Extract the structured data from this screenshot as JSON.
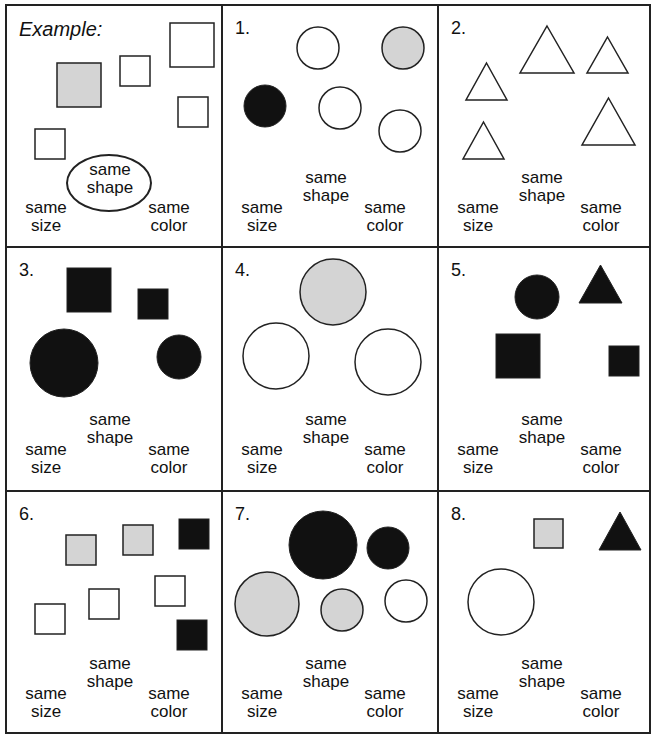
{
  "colors": {
    "line": "#222222",
    "black": "#111111",
    "gray": "#d4d4d4",
    "white": "#ffffff"
  },
  "labels": {
    "size_1": "same",
    "size_2": "size",
    "shape_1": "same",
    "shape_2": "shape",
    "color_1": "same",
    "color_2": "color"
  },
  "panels": [
    {
      "id": "example",
      "number": "Example:",
      "highlighted": "same shape",
      "shapes": [
        {
          "type": "square",
          "fill": "gray",
          "x": 50,
          "y": 57,
          "s": 44
        },
        {
          "type": "square",
          "fill": "white",
          "x": 113,
          "y": 50,
          "s": 30
        },
        {
          "type": "square",
          "fill": "white",
          "x": 163,
          "y": 17,
          "s": 44
        },
        {
          "type": "square",
          "fill": "white",
          "x": 171,
          "y": 91,
          "s": 30
        },
        {
          "type": "square",
          "fill": "white",
          "x": 28,
          "y": 123,
          "s": 30
        }
      ]
    },
    {
      "id": "1",
      "number": "1.",
      "shapes": [
        {
          "type": "circle",
          "fill": "white",
          "cx": 95,
          "cy": 42,
          "r": 21
        },
        {
          "type": "circle",
          "fill": "gray",
          "cx": 180,
          "cy": 42,
          "r": 21
        },
        {
          "type": "circle",
          "fill": "black",
          "cx": 42,
          "cy": 100,
          "r": 21
        },
        {
          "type": "circle",
          "fill": "white",
          "cx": 117,
          "cy": 102,
          "r": 21
        },
        {
          "type": "circle",
          "fill": "white",
          "cx": 177,
          "cy": 125,
          "r": 21
        }
      ]
    },
    {
      "id": "2",
      "number": "2.",
      "shapes": [
        {
          "type": "triangle",
          "fill": "white",
          "x": 81,
          "y": 20,
          "w": 54,
          "h": 47
        },
        {
          "type": "triangle",
          "fill": "white",
          "x": 148,
          "y": 31,
          "w": 41,
          "h": 36
        },
        {
          "type": "triangle",
          "fill": "white",
          "x": 27,
          "y": 57,
          "w": 41,
          "h": 37
        },
        {
          "type": "triangle",
          "fill": "white",
          "x": 143,
          "y": 92,
          "w": 53,
          "h": 47
        },
        {
          "type": "triangle",
          "fill": "white",
          "x": 24,
          "y": 116,
          "w": 41,
          "h": 37
        }
      ]
    },
    {
      "id": "3",
      "number": "3.",
      "shapes": [
        {
          "type": "square",
          "fill": "black",
          "x": 60,
          "y": 20,
          "s": 44
        },
        {
          "type": "square",
          "fill": "black",
          "x": 131,
          "y": 41,
          "s": 30
        },
        {
          "type": "circle",
          "fill": "black",
          "cx": 57,
          "cy": 115,
          "r": 34
        },
        {
          "type": "circle",
          "fill": "black",
          "cx": 172,
          "cy": 109,
          "r": 22
        }
      ]
    },
    {
      "id": "4",
      "number": "4.",
      "shapes": [
        {
          "type": "circle",
          "fill": "gray",
          "cx": 110,
          "cy": 44,
          "r": 33
        },
        {
          "type": "circle",
          "fill": "white",
          "cx": 53,
          "cy": 108,
          "r": 33
        },
        {
          "type": "circle",
          "fill": "white",
          "cx": 165,
          "cy": 114,
          "r": 33
        }
      ]
    },
    {
      "id": "5",
      "number": "5.",
      "shapes": [
        {
          "type": "circle",
          "fill": "black",
          "cx": 98,
          "cy": 49,
          "r": 22
        },
        {
          "type": "triangle",
          "fill": "black",
          "x": 140,
          "y": 17,
          "w": 43,
          "h": 38
        },
        {
          "type": "square",
          "fill": "black",
          "x": 57,
          "y": 86,
          "s": 44
        },
        {
          "type": "square",
          "fill": "black",
          "x": 170,
          "y": 98,
          "s": 30
        }
      ]
    },
    {
      "id": "6",
      "number": "6.",
      "shapes": [
        {
          "type": "square",
          "fill": "gray",
          "x": 59,
          "y": 43,
          "s": 30
        },
        {
          "type": "square",
          "fill": "gray",
          "x": 116,
          "y": 33,
          "s": 30
        },
        {
          "type": "square",
          "fill": "black",
          "x": 172,
          "y": 27,
          "s": 30
        },
        {
          "type": "square",
          "fill": "white",
          "x": 148,
          "y": 84,
          "s": 30
        },
        {
          "type": "square",
          "fill": "white",
          "x": 82,
          "y": 97,
          "s": 30
        },
        {
          "type": "square",
          "fill": "white",
          "x": 28,
          "y": 112,
          "s": 30
        },
        {
          "type": "square",
          "fill": "black",
          "x": 170,
          "y": 128,
          "s": 30
        }
      ]
    },
    {
      "id": "7",
      "number": "7.",
      "shapes": [
        {
          "type": "circle",
          "fill": "black",
          "cx": 100,
          "cy": 53,
          "r": 34
        },
        {
          "type": "circle",
          "fill": "black",
          "cx": 165,
          "cy": 56,
          "r": 21
        },
        {
          "type": "circle",
          "fill": "gray",
          "cx": 44,
          "cy": 112,
          "r": 32
        },
        {
          "type": "circle",
          "fill": "gray",
          "cx": 119,
          "cy": 118,
          "r": 21
        },
        {
          "type": "circle",
          "fill": "white",
          "cx": 183,
          "cy": 109,
          "r": 21
        }
      ]
    },
    {
      "id": "8",
      "number": "8.",
      "shapes": [
        {
          "type": "square",
          "fill": "gray",
          "x": 95,
          "y": 27,
          "s": 29
        },
        {
          "type": "triangle",
          "fill": "black",
          "x": 160,
          "y": 20,
          "w": 42,
          "h": 38
        },
        {
          "type": "circle",
          "fill": "white",
          "cx": 62,
          "cy": 110,
          "r": 33
        }
      ]
    }
  ]
}
